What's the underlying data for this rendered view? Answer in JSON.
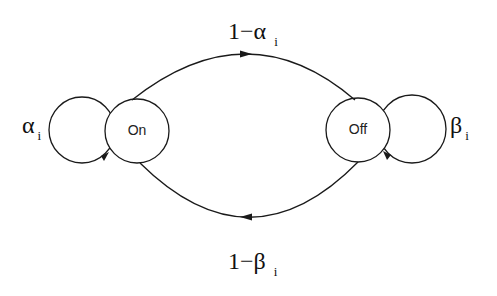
{
  "diagram": {
    "type": "state-transition",
    "states": [
      {
        "id": "on",
        "label": "On"
      },
      {
        "id": "off",
        "label": "Off"
      }
    ],
    "transitions": [
      {
        "from": "on",
        "to": "on",
        "label_symbol": "α",
        "label_sub": "i"
      },
      {
        "from": "off",
        "to": "off",
        "label_symbol": "β",
        "label_sub": "i"
      },
      {
        "from": "on",
        "to": "off",
        "label_prefix": "1−",
        "label_symbol": "α",
        "label_sub": "i"
      },
      {
        "from": "off",
        "to": "on",
        "label_prefix": "1−",
        "label_symbol": "β",
        "label_sub": "i"
      }
    ],
    "colors": {
      "stroke": "#1a1a1a",
      "background": "#ffffff"
    }
  }
}
